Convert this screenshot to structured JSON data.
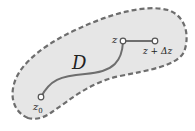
{
  "diagram": {
    "region_label": "D",
    "points": [
      {
        "id": "z0",
        "label": "z",
        "subscript": "0"
      },
      {
        "id": "z",
        "label": "z"
      },
      {
        "id": "z_plus_dz",
        "label": "z + Δz"
      }
    ],
    "colors": {
      "region_fill": "#e6e6e6",
      "region_outline": "#6e6e6e",
      "curve": "#6e6e6e",
      "point_fill": "#ffffff"
    }
  }
}
